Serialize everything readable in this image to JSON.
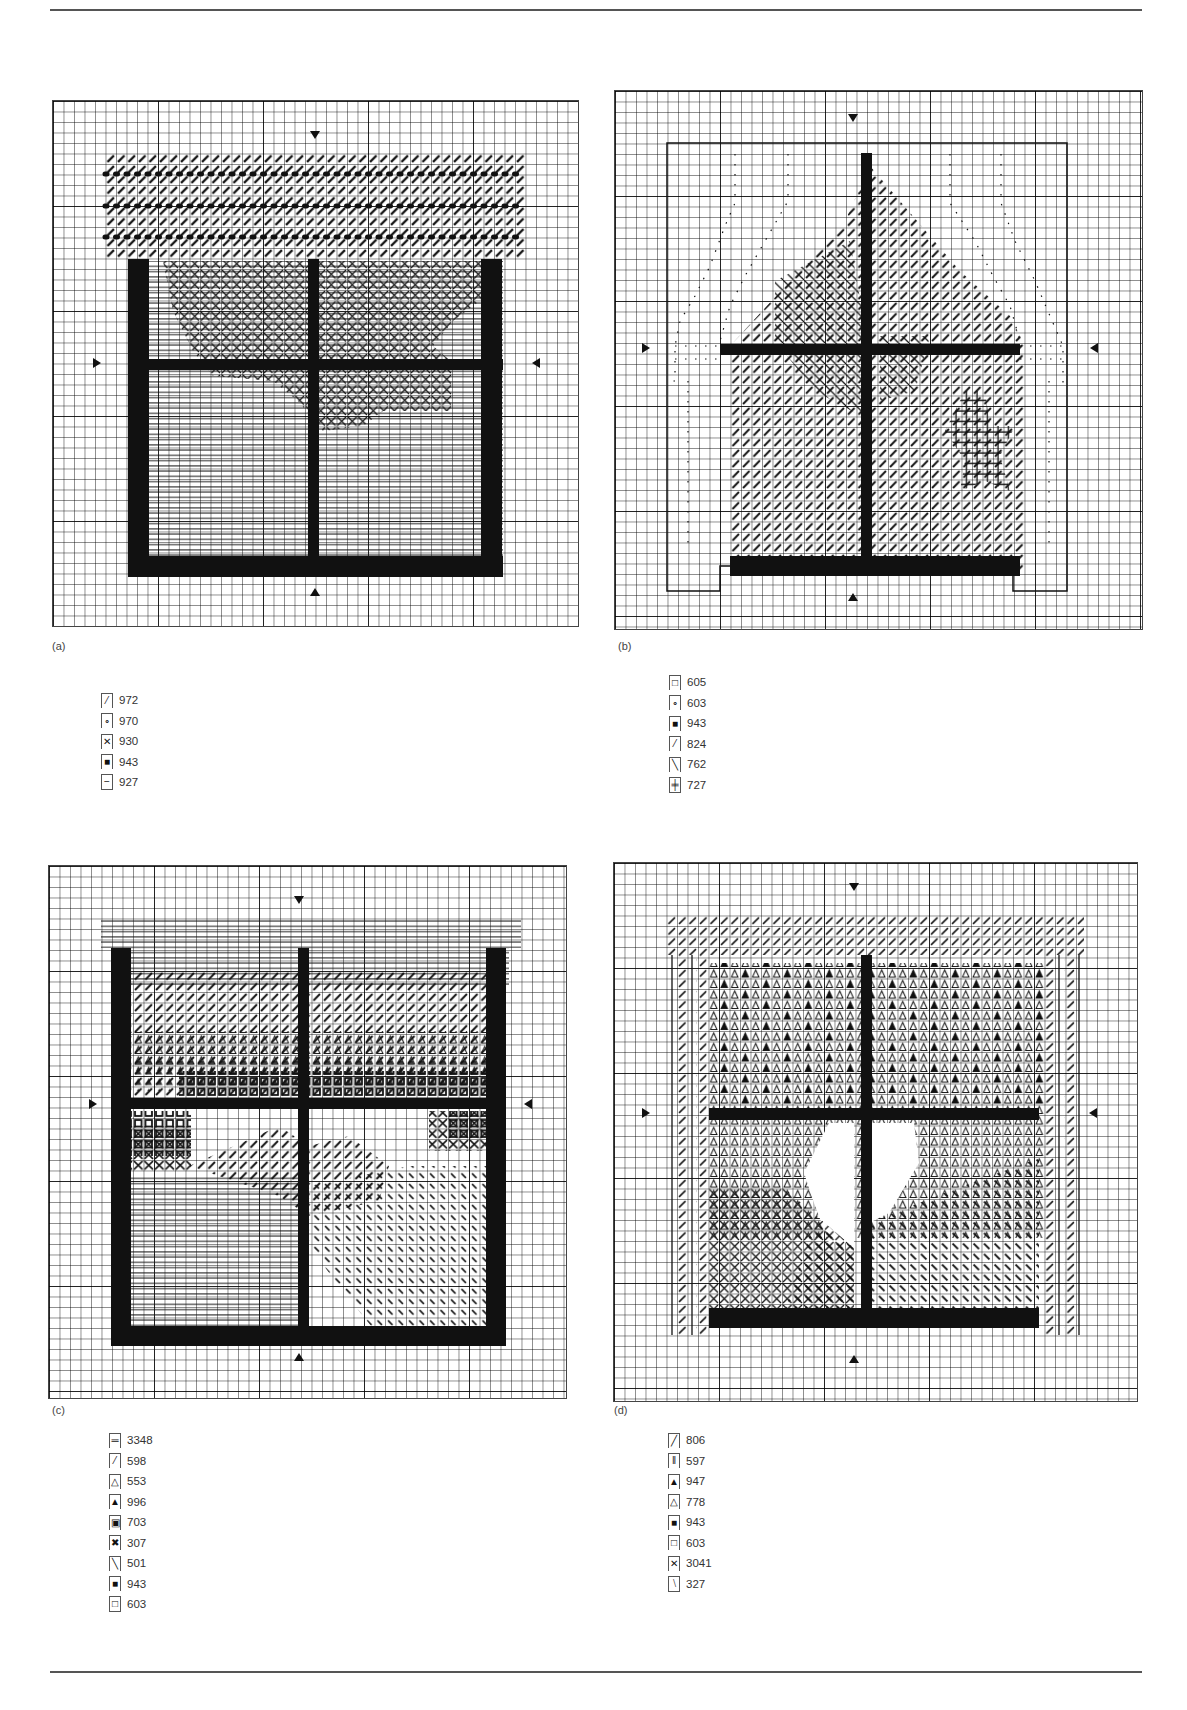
{
  "page": {
    "figure_labels": [
      "(a)",
      "(b)",
      "(c)",
      "(d)"
    ]
  },
  "panels": [
    {
      "id": "a",
      "label": "(a)",
      "key": [
        {
          "symbol": "slash-bold",
          "glyph": "⁄",
          "code": "972"
        },
        {
          "symbol": "circle",
          "glyph": "∘",
          "code": "970"
        },
        {
          "symbol": "cross",
          "glyph": "✕",
          "code": "930"
        },
        {
          "symbol": "solid",
          "glyph": "■",
          "code": "943"
        },
        {
          "symbol": "horizontal-line",
          "glyph": "−",
          "code": "927"
        }
      ]
    },
    {
      "id": "b",
      "label": "(b)",
      "key": [
        {
          "symbol": "empty-square",
          "glyph": "□",
          "code": "605"
        },
        {
          "symbol": "circle",
          "glyph": "∘",
          "code": "603"
        },
        {
          "symbol": "solid",
          "glyph": "■",
          "code": "943"
        },
        {
          "symbol": "slash-bold",
          "glyph": "⁄",
          "code": "824"
        },
        {
          "symbol": "backslash",
          "glyph": "╲",
          "code": "762"
        },
        {
          "symbol": "plus",
          "glyph": "╪",
          "code": "727"
        }
      ]
    },
    {
      "id": "c",
      "label": "(c)",
      "key": [
        {
          "symbol": "double-line",
          "glyph": "═",
          "code": "3348"
        },
        {
          "symbol": "slash-bold",
          "glyph": "⁄",
          "code": "598"
        },
        {
          "symbol": "open-triangle",
          "glyph": "△",
          "code": "553"
        },
        {
          "symbol": "filled-triangle",
          "glyph": "▲",
          "code": "996"
        },
        {
          "symbol": "bold-square",
          "glyph": "▣",
          "code": "703"
        },
        {
          "symbol": "bold-cross",
          "glyph": "✖",
          "code": "307"
        },
        {
          "symbol": "backslash",
          "glyph": "╲",
          "code": "501"
        },
        {
          "symbol": "solid",
          "glyph": "■",
          "code": "943"
        },
        {
          "symbol": "empty-square",
          "glyph": "□",
          "code": "603"
        }
      ]
    },
    {
      "id": "d",
      "label": "(d)",
      "key": [
        {
          "symbol": "slash",
          "glyph": "╱",
          "code": "806"
        },
        {
          "symbol": "vertical-bars",
          "glyph": "‖",
          "code": "597"
        },
        {
          "symbol": "filled-triangle",
          "glyph": "▲",
          "code": "947"
        },
        {
          "symbol": "open-triangle",
          "glyph": "△",
          "code": "778"
        },
        {
          "symbol": "solid",
          "glyph": "■",
          "code": "943"
        },
        {
          "symbol": "empty-square",
          "glyph": "□",
          "code": "603"
        },
        {
          "symbol": "cross",
          "glyph": "✕",
          "code": "3041"
        },
        {
          "symbol": "backslash-bold",
          "glyph": "⧵",
          "code": "327"
        }
      ]
    }
  ]
}
